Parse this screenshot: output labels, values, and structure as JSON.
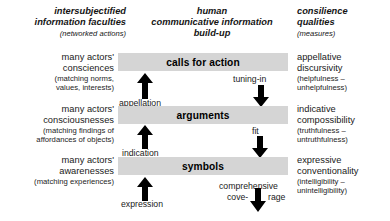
{
  "diagram": {
    "title": "human communicative information build-up",
    "columns": [
      {
        "id": "left",
        "header_line1": "intersubjectified",
        "header_line2": "information faculties",
        "header_sub": "(networked actions)"
      },
      {
        "id": "center",
        "header_line1": "human",
        "header_line2": "communicative information",
        "header_line3": "build-up"
      },
      {
        "id": "right",
        "header_line1": "consilience",
        "header_line2": "qualities",
        "header_sub": "(measures)"
      }
    ],
    "levels": [
      {
        "id": "level-calls-for-action",
        "faculty_line1": "many actors'",
        "faculty_line2": "consciences",
        "faculty_paren_line1": "(matching norms,",
        "faculty_paren_line2": "values, interests)",
        "band_label": "calls for action",
        "quality_line1": "appellative",
        "quality_line2": "discursivity",
        "quality_paren_line1": "(helpfulness –",
        "quality_paren_line2": "unhelpfulness)"
      },
      {
        "id": "level-arguments",
        "faculty_line1": "many actors'",
        "faculty_line2": "consciousnesses",
        "faculty_paren_line1": "(matching findings of",
        "faculty_paren_line2": "affordances of objects)",
        "band_label": "arguments",
        "quality_line1": "indicative",
        "quality_line2": "compossibility",
        "quality_paren_line1": "(truthfulness –",
        "quality_paren_line2": "untruthfulness)"
      },
      {
        "id": "level-symbols",
        "faculty_line1": "many actors'",
        "faculty_line2": "awarenesses",
        "faculty_paren_line1": "(matching experiences)",
        "faculty_paren_line2": "",
        "band_label": "symbols",
        "quality_line1": "expressive",
        "quality_line2": "conventionality",
        "quality_paren_line1": "(intelligibility –",
        "quality_paren_line2": "unintelligibility)"
      }
    ],
    "up_arrows": [
      {
        "id": "arrow-appellation",
        "label": "appellation"
      },
      {
        "id": "arrow-indication",
        "label": "indication"
      },
      {
        "id": "arrow-expression",
        "label": "expression"
      }
    ],
    "down_arrows": [
      {
        "id": "arrow-tuning-in",
        "label": "tuning-in"
      },
      {
        "id": "arrow-fit",
        "label": "fit"
      },
      {
        "id": "arrow-coverage",
        "label_line1": "comprehensive",
        "label_left": "cove-",
        "label_right": "rage"
      }
    ],
    "colors": {
      "band_fill": "#d5d5d5",
      "text": "#1a1a1a",
      "arrow": "#000000",
      "background": "#ffffff"
    }
  }
}
